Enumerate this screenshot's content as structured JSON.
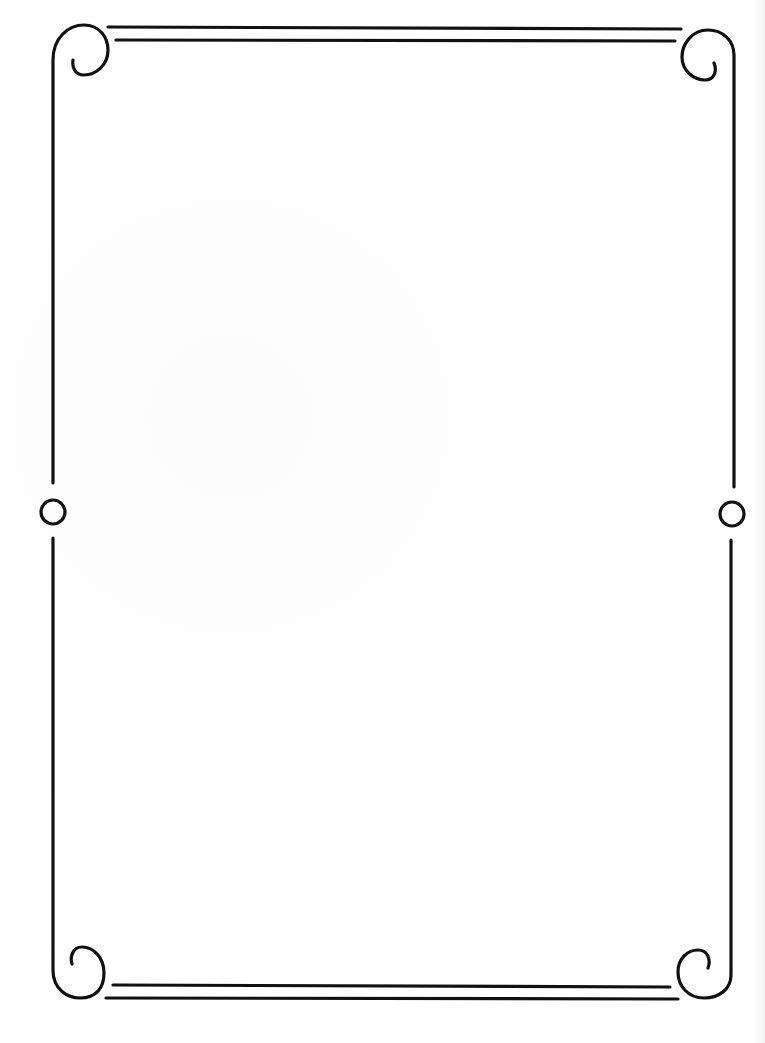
{
  "page": {
    "background_color": "#ffffff",
    "stroke_color": "#111111"
  },
  "frame": {
    "corners": [
      "top-left-scroll",
      "top-right-scroll",
      "bottom-left-scroll",
      "bottom-right-scroll"
    ],
    "side_ornaments": [
      "left-ring",
      "right-ring"
    ],
    "top_rule_count": 2,
    "bottom_rule_count": 2
  }
}
